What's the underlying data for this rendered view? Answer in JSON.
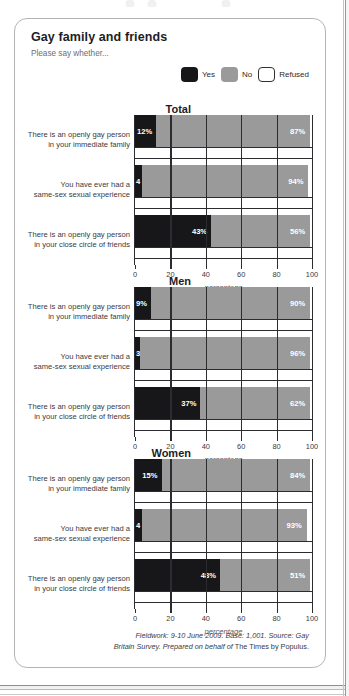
{
  "card": {
    "title": "Gay family and friends",
    "subtitle": "Please say whether..."
  },
  "legend": {
    "items": [
      {
        "label": "Yes",
        "key": "yes",
        "color": "#17171a"
      },
      {
        "label": "No",
        "key": "no",
        "color": "#9a9a9a"
      },
      {
        "label": "Refused",
        "key": "refused",
        "color": "#ffffff"
      }
    ]
  },
  "axis": {
    "ticks": [
      0,
      20,
      40,
      60,
      80,
      100
    ],
    "caption": "percentage",
    "min": 0,
    "max": 100
  },
  "footer": {
    "line1": "Fieldwork: 9-10 June 2009. Base: 1,001. Source: Gay",
    "line2_italic": "Britain Survey. Prepared on behalf of",
    "line2_rest": " The Times by Populus."
  },
  "chart_data": {
    "type": "bar",
    "title": "Gay family and friends",
    "subtitle": "Please say whether...",
    "xlabel": "percentage",
    "ylabel": "",
    "xlim": [
      0,
      100
    ],
    "grid": false,
    "legend_position": "top-right",
    "stacked": true,
    "series": [
      {
        "name": "Yes",
        "color": "#17171a"
      },
      {
        "name": "No",
        "color": "#9a9a9a"
      },
      {
        "name": "Refused",
        "color": "#ffffff"
      }
    ],
    "groups": [
      {
        "name": "Total",
        "rows": [
          {
            "label_line1": "There is an openly gay person",
            "label_line2": "in your immediate family",
            "yes": 12,
            "no": 87,
            "yes_label": "12%",
            "no_label": "87%"
          },
          {
            "label_line1": "You have ever had a",
            "label_line2": "same-sex sexual experience",
            "yes": 4,
            "no": 94,
            "yes_label": "4",
            "no_label": "94%"
          },
          {
            "label_line1": "There is an openly gay person",
            "label_line2": "in your close circle of friends",
            "yes": 43,
            "no": 56,
            "yes_label": "43%",
            "no_label": "56%"
          }
        ]
      },
      {
        "name": "Men",
        "rows": [
          {
            "label_line1": "There is an openly gay person",
            "label_line2": "in your immediate family",
            "yes": 9,
            "no": 90,
            "yes_label": "9%",
            "no_label": "90%"
          },
          {
            "label_line1": "You have ever had a",
            "label_line2": "same-sex sexual experience",
            "yes": 3,
            "no": 96,
            "yes_label": "3",
            "no_label": "96%"
          },
          {
            "label_line1": "There is an openly gay person",
            "label_line2": "in your close circle of friends",
            "yes": 37,
            "no": 62,
            "yes_label": "37%",
            "no_label": "62%"
          }
        ]
      },
      {
        "name": "Women",
        "rows": [
          {
            "label_line1": "There is an openly gay person",
            "label_line2": "in your immediate family",
            "yes": 15,
            "no": 84,
            "yes_label": "15%",
            "no_label": "84%"
          },
          {
            "label_line1": "You have ever had a",
            "label_line2": "same-sex sexual experience",
            "yes": 4,
            "no": 93,
            "yes_label": "4",
            "no_label": "93%"
          },
          {
            "label_line1": "There is an openly gay person",
            "label_line2": "in your close circle of friends",
            "yes": 48,
            "no": 51,
            "yes_label": "48%",
            "no_label": "51%"
          }
        ]
      }
    ]
  }
}
